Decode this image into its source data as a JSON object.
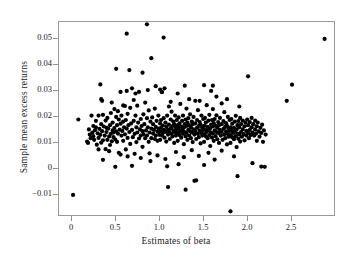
{
  "chart_data": {
    "type": "scatter",
    "title": "",
    "xlabel": "Estimates of beta",
    "ylabel": "Sample mean excess returns",
    "xlim": [
      -0.15,
      3.0
    ],
    "ylim": [
      -0.0185,
      0.0565
    ],
    "grid": false,
    "legend": null,
    "xticks": [
      0,
      0.5,
      1.0,
      1.5,
      2.0,
      2.5
    ],
    "xtick_labels": [
      "0",
      "0.5",
      "1.0",
      "1.5",
      "2.0",
      "2.5"
    ],
    "yticks": [
      0.05,
      0.04,
      0.03,
      0.02,
      0.01,
      0,
      -0.01
    ],
    "ytick_labels": [
      "0.05",
      "0.04",
      "0.03",
      "0.02",
      "0.01",
      "0",
      "−0.01"
    ],
    "marker": "filled-circle",
    "marker_color": "#000000",
    "marker_size_px": 2.1,
    "n_points": 402,
    "points": [
      [
        0.01,
        -0.01
      ],
      [
        0.07,
        0.019
      ],
      [
        0.17,
        0.0105
      ],
      [
        0.18,
        0.01
      ],
      [
        0.19,
        0.0152
      ],
      [
        0.2,
        0.0132
      ],
      [
        0.21,
        0.0118
      ],
      [
        0.22,
        0.0205
      ],
      [
        0.23,
        0.014
      ],
      [
        0.24,
        0.0126
      ],
      [
        0.25,
        0.0112
      ],
      [
        0.26,
        0.0149
      ],
      [
        0.27,
        0.016
      ],
      [
        0.28,
        0.0093
      ],
      [
        0.29,
        0.0137
      ],
      [
        0.3,
        0.0205
      ],
      [
        0.3,
        0.0119
      ],
      [
        0.31,
        0.0154
      ],
      [
        0.32,
        0.0325
      ],
      [
        0.32,
        0.0131
      ],
      [
        0.33,
        0.0268
      ],
      [
        0.33,
        0.0101
      ],
      [
        0.34,
        0.0262
      ],
      [
        0.34,
        0.0145
      ],
      [
        0.35,
        0.011
      ],
      [
        0.35,
        0.0035
      ],
      [
        0.36,
        0.0163
      ],
      [
        0.37,
        0.0128
      ],
      [
        0.38,
        0.0186
      ],
      [
        0.38,
        0.0076
      ],
      [
        0.39,
        0.0142
      ],
      [
        0.4,
        0.0196
      ],
      [
        0.4,
        0.0112
      ],
      [
        0.41,
        0.0155
      ],
      [
        0.42,
        0.0125
      ],
      [
        0.43,
        0.0168
      ],
      [
        0.43,
        0.0092
      ],
      [
        0.44,
        0.0215
      ],
      [
        0.44,
        0.0135
      ],
      [
        0.45,
        0.0106
      ],
      [
        0.46,
        0.0178
      ],
      [
        0.46,
        0.0148
      ],
      [
        0.47,
        0.0122
      ],
      [
        0.48,
        0.023
      ],
      [
        0.48,
        0.0157
      ],
      [
        0.49,
        0.0113
      ],
      [
        0.5,
        0.0385
      ],
      [
        0.5,
        0.02
      ],
      [
        0.5,
        0.0144
      ],
      [
        0.51,
        0.0168
      ],
      [
        0.51,
        0.0104
      ],
      [
        0.52,
        0.0222
      ],
      [
        0.52,
        0.0136
      ],
      [
        0.53,
        0.019
      ],
      [
        0.53,
        0.0062
      ],
      [
        0.54,
        0.0151
      ],
      [
        0.55,
        0.0296
      ],
      [
        0.55,
        0.0174
      ],
      [
        0.56,
        0.0128
      ],
      [
        0.56,
        0.0205
      ],
      [
        0.57,
        0.0146
      ],
      [
        0.58,
        0.0182
      ],
      [
        0.58,
        0.0108
      ],
      [
        0.59,
        0.016
      ],
      [
        0.6,
        0.0242
      ],
      [
        0.6,
        0.0133
      ],
      [
        0.61,
        0.0188
      ],
      [
        0.61,
        0.0075
      ],
      [
        0.62,
        0.052
      ],
      [
        0.62,
        0.0155
      ],
      [
        0.63,
        0.0212
      ],
      [
        0.63,
        0.0119
      ],
      [
        0.64,
        0.0168
      ],
      [
        0.65,
        0.038
      ],
      [
        0.65,
        0.0142
      ],
      [
        0.66,
        0.0235
      ],
      [
        0.66,
        0.0096
      ],
      [
        0.67,
        0.0175
      ],
      [
        0.68,
        0.031
      ],
      [
        0.68,
        0.015
      ],
      [
        0.69,
        0.0122
      ],
      [
        0.7,
        0.0265
      ],
      [
        0.7,
        0.0185
      ],
      [
        0.71,
        0.0135
      ],
      [
        0.71,
        0.0058
      ],
      [
        0.72,
        0.0205
      ],
      [
        0.73,
        0.016
      ],
      [
        0.73,
        0.0103
      ],
      [
        0.74,
        0.0243
      ],
      [
        0.74,
        0.014
      ],
      [
        0.75,
        0.0178
      ],
      [
        0.76,
        0.0117
      ],
      [
        0.76,
        0.0296
      ],
      [
        0.77,
        0.0152
      ],
      [
        0.78,
        0.0192
      ],
      [
        0.78,
        0.0128
      ],
      [
        0.79,
        0.0165
      ],
      [
        0.8,
        0.037
      ],
      [
        0.8,
        0.0145
      ],
      [
        0.8,
        0.0085
      ],
      [
        0.81,
        0.021
      ],
      [
        0.81,
        0.0133
      ],
      [
        0.82,
        0.0172
      ],
      [
        0.83,
        0.0118
      ],
      [
        0.83,
        0.0255
      ],
      [
        0.84,
        0.0148
      ],
      [
        0.85,
        0.0556
      ],
      [
        0.85,
        0.0195
      ],
      [
        0.85,
        0.0128
      ],
      [
        0.86,
        0.016
      ],
      [
        0.87,
        0.0225
      ],
      [
        0.87,
        0.0104
      ],
      [
        0.88,
        0.014
      ],
      [
        0.89,
        0.0182
      ],
      [
        0.89,
        0.003
      ],
      [
        0.9,
        0.0426
      ],
      [
        0.9,
        0.0155
      ],
      [
        0.9,
        0.0118
      ],
      [
        0.91,
        0.0198
      ],
      [
        0.92,
        0.0136
      ],
      [
        0.92,
        0.0172
      ],
      [
        0.93,
        0.015
      ],
      [
        0.94,
        0.0115
      ],
      [
        0.94,
        0.0232
      ],
      [
        0.95,
        0.0162
      ],
      [
        0.95,
        0.0128
      ],
      [
        0.96,
        0.0185
      ],
      [
        0.97,
        0.0143
      ],
      [
        0.97,
        0.0108
      ],
      [
        0.98,
        0.0205
      ],
      [
        0.98,
        0.0155
      ],
      [
        0.99,
        0.0131
      ],
      [
        1.0,
        0.0305
      ],
      [
        1.0,
        0.0175
      ],
      [
        1.0,
        0.0145
      ],
      [
        1.0,
        0.0112
      ],
      [
        1.01,
        0.0188
      ],
      [
        1.01,
        0.0158
      ],
      [
        1.02,
        0.0128
      ],
      [
        1.02,
        0.0296
      ],
      [
        1.03,
        0.0167
      ],
      [
        1.03,
        0.0138
      ],
      [
        1.04,
        0.0505
      ],
      [
        1.04,
        0.0195
      ],
      [
        1.04,
        0.015
      ],
      [
        1.05,
        0.012
      ],
      [
        1.05,
        0.031
      ],
      [
        1.06,
        0.0178
      ],
      [
        1.06,
        0.0142
      ],
      [
        1.07,
        0.0163
      ],
      [
        1.07,
        0.0105
      ],
      [
        1.08,
        0.0205
      ],
      [
        1.08,
        0.0152
      ],
      [
        1.09,
        0.0132
      ],
      [
        1.09,
        -0.007
      ],
      [
        1.1,
        0.024
      ],
      [
        1.1,
        0.017
      ],
      [
        1.1,
        0.0144
      ],
      [
        1.11,
        0.0115
      ],
      [
        1.12,
        0.019
      ],
      [
        1.12,
        0.0156
      ],
      [
        1.13,
        0.0135
      ],
      [
        1.13,
        0.022
      ],
      [
        1.14,
        0.0165
      ],
      [
        1.14,
        0.0125
      ],
      [
        1.15,
        0.0182
      ],
      [
        1.15,
        0.0148
      ],
      [
        1.16,
        0.0172
      ],
      [
        1.16,
        0.01
      ],
      [
        1.17,
        0.0205
      ],
      [
        1.17,
        0.014
      ],
      [
        1.18,
        0.016
      ],
      [
        1.18,
        0.0128
      ],
      [
        1.19,
        0.0188
      ],
      [
        1.19,
        0.0152
      ],
      [
        1.2,
        0.029
      ],
      [
        1.2,
        0.0168
      ],
      [
        1.2,
        0.0138
      ],
      [
        1.2,
        0.0108
      ],
      [
        1.21,
        0.0198
      ],
      [
        1.21,
        0.0155
      ],
      [
        1.22,
        0.013
      ],
      [
        1.22,
        0.0175
      ],
      [
        1.23,
        0.0145
      ],
      [
        1.23,
        0.025
      ],
      [
        1.24,
        0.0163
      ],
      [
        1.24,
        0.012
      ],
      [
        1.25,
        0.0185
      ],
      [
        1.25,
        0.015
      ],
      [
        1.26,
        0.0135
      ],
      [
        1.26,
        0.0205
      ],
      [
        1.27,
        0.0158
      ],
      [
        1.27,
        0.0095
      ],
      [
        1.28,
        0.032
      ],
      [
        1.28,
        0.0172
      ],
      [
        1.28,
        0.0142
      ],
      [
        1.29,
        0.019
      ],
      [
        1.29,
        0.0125
      ],
      [
        1.29,
        -0.008
      ],
      [
        1.3,
        0.0232
      ],
      [
        1.3,
        0.0165
      ],
      [
        1.3,
        0.0138
      ],
      [
        1.31,
        0.0178
      ],
      [
        1.31,
        0.0112
      ],
      [
        1.32,
        0.0195
      ],
      [
        1.32,
        0.015
      ],
      [
        1.33,
        0.0128
      ],
      [
        1.33,
        0.0168
      ],
      [
        1.34,
        0.0145
      ],
      [
        1.34,
        0.021
      ],
      [
        1.35,
        0.016
      ],
      [
        1.35,
        0.0118
      ],
      [
        1.36,
        0.0182
      ],
      [
        1.36,
        0.014
      ],
      [
        1.37,
        0.0172
      ],
      [
        1.37,
        0.0103
      ],
      [
        1.38,
        0.02
      ],
      [
        1.38,
        0.0152
      ],
      [
        1.39,
        0.0132
      ],
      [
        1.39,
        -0.0046
      ],
      [
        1.4,
        0.0262
      ],
      [
        1.4,
        0.0175
      ],
      [
        1.4,
        0.0145
      ],
      [
        1.41,
        0.0115
      ],
      [
        1.41,
        -0.0044
      ],
      [
        1.42,
        0.0188
      ],
      [
        1.42,
        0.0158
      ],
      [
        1.43,
        0.0135
      ],
      [
        1.43,
        0.0226
      ],
      [
        1.44,
        0.0165
      ],
      [
        1.44,
        0.0122
      ],
      [
        1.45,
        0.018
      ],
      [
        1.45,
        0.0148
      ],
      [
        1.46,
        0.017
      ],
      [
        1.46,
        0.0098
      ],
      [
        1.47,
        0.0205
      ],
      [
        1.47,
        0.0138
      ],
      [
        1.48,
        0.016
      ],
      [
        1.48,
        0.0128
      ],
      [
        1.49,
        0.0192
      ],
      [
        1.49,
        0.015
      ],
      [
        1.5,
        0.0322
      ],
      [
        1.5,
        0.0166
      ],
      [
        1.5,
        0.0134
      ],
      [
        1.5,
        0.0104
      ],
      [
        1.51,
        0.0196
      ],
      [
        1.51,
        0.0152
      ],
      [
        1.52,
        0.0126
      ],
      [
        1.52,
        0.0178
      ],
      [
        1.53,
        0.0142
      ],
      [
        1.53,
        0.0245
      ],
      [
        1.54,
        0.0162
      ],
      [
        1.54,
        0.0118
      ],
      [
        1.55,
        0.0186
      ],
      [
        1.55,
        0.0148
      ],
      [
        1.56,
        0.013
      ],
      [
        1.56,
        0.0208
      ],
      [
        1.57,
        0.0156
      ],
      [
        1.57,
        0.0088
      ],
      [
        1.58,
        0.03
      ],
      [
        1.58,
        0.017
      ],
      [
        1.58,
        0.014
      ],
      [
        1.59,
        0.0188
      ],
      [
        1.59,
        0.012
      ],
      [
        1.6,
        0.032
      ],
      [
        1.6,
        0.023
      ],
      [
        1.6,
        0.0164
      ],
      [
        1.6,
        0.0136
      ],
      [
        1.61,
        0.0176
      ],
      [
        1.61,
        0.0108
      ],
      [
        1.62,
        0.0192
      ],
      [
        1.62,
        0.0148
      ],
      [
        1.63,
        0.0126
      ],
      [
        1.63,
        0.0166
      ],
      [
        1.64,
        0.0142
      ],
      [
        1.64,
        0.0206
      ],
      [
        1.65,
        0.0158
      ],
      [
        1.65,
        0.0114
      ],
      [
        1.66,
        0.018
      ],
      [
        1.66,
        0.0138
      ],
      [
        1.67,
        0.0168
      ],
      [
        1.67,
        0.01
      ],
      [
        1.68,
        0.0196
      ],
      [
        1.68,
        0.015
      ],
      [
        1.69,
        0.0128
      ],
      [
        1.7,
        0.0252
      ],
      [
        1.7,
        0.0172
      ],
      [
        1.7,
        0.0142
      ],
      [
        1.71,
        0.0112
      ],
      [
        1.72,
        0.0184
      ],
      [
        1.72,
        0.0154
      ],
      [
        1.73,
        0.0132
      ],
      [
        1.73,
        0.0218
      ],
      [
        1.74,
        0.0162
      ],
      [
        1.74,
        0.0118
      ],
      [
        1.75,
        0.0176
      ],
      [
        1.75,
        0.0144
      ],
      [
        1.76,
        0.0166
      ],
      [
        1.76,
        0.0094
      ],
      [
        1.77,
        0.02
      ],
      [
        1.77,
        0.0134
      ],
      [
        1.78,
        0.0156
      ],
      [
        1.78,
        0.0124
      ],
      [
        1.79,
        0.0188
      ],
      [
        1.79,
        0.0146
      ],
      [
        1.8,
        0.016
      ],
      [
        1.8,
        0.013
      ],
      [
        1.8,
        0.01
      ],
      [
        1.8,
        -0.0163
      ],
      [
        1.81,
        0.0192
      ],
      [
        1.81,
        0.0148
      ],
      [
        1.82,
        0.0122
      ],
      [
        1.82,
        0.0174
      ],
      [
        1.83,
        0.0138
      ],
      [
        1.84,
        0.0158
      ],
      [
        1.84,
        0.0114
      ],
      [
        1.85,
        0.0182
      ],
      [
        1.85,
        0.0144
      ],
      [
        1.86,
        0.0126
      ],
      [
        1.86,
        0.0204
      ],
      [
        1.87,
        0.0152
      ],
      [
        1.87,
        0.0084
      ],
      [
        1.88,
        0.0168
      ],
      [
        1.88,
        0.0136
      ],
      [
        1.88,
        -0.0028
      ],
      [
        1.89,
        0.0184
      ],
      [
        1.89,
        0.0116
      ],
      [
        1.9,
        0.024
      ],
      [
        1.9,
        0.016
      ],
      [
        1.9,
        0.0132
      ],
      [
        1.91,
        0.0196
      ],
      [
        1.91,
        0.0105
      ],
      [
        1.92,
        0.0172
      ],
      [
        1.92,
        0.0142
      ],
      [
        1.93,
        0.0124
      ],
      [
        1.94,
        0.0186
      ],
      [
        1.94,
        0.0152
      ],
      [
        1.95,
        0.0134
      ],
      [
        1.96,
        0.0164
      ],
      [
        1.96,
        0.011
      ],
      [
        1.97,
        0.0178
      ],
      [
        1.98,
        0.0146
      ],
      [
        1.98,
        0.0128
      ],
      [
        1.99,
        0.019
      ],
      [
        2.0,
        0.0356
      ],
      [
        2.0,
        0.0168
      ],
      [
        2.0,
        0.0138
      ],
      [
        2.01,
        0.0118
      ],
      [
        2.02,
        0.018
      ],
      [
        2.02,
        0.015
      ],
      [
        2.03,
        0.013
      ],
      [
        2.04,
        0.0196
      ],
      [
        2.04,
        0.016
      ],
      [
        2.05,
        0.014
      ],
      [
        2.05,
        0.0022
      ],
      [
        2.06,
        0.0172
      ],
      [
        2.07,
        0.0128
      ],
      [
        2.08,
        0.0186
      ],
      [
        2.08,
        0.0152
      ],
      [
        2.09,
        0.0136
      ],
      [
        2.1,
        0.0164
      ],
      [
        2.1,
        0.0108
      ],
      [
        2.11,
        0.0178
      ],
      [
        2.12,
        0.0144
      ],
      [
        2.13,
        0.0124
      ],
      [
        2.14,
        0.0158
      ],
      [
        2.15,
        0.0138
      ],
      [
        2.15,
        0.0009
      ],
      [
        2.16,
        0.017
      ],
      [
        2.17,
        0.0104
      ],
      [
        2.18,
        0.0148
      ],
      [
        2.19,
        0.0008
      ],
      [
        2.2,
        0.0132
      ],
      [
        2.44,
        0.0262
      ],
      [
        2.5,
        0.0324
      ],
      [
        2.87,
        0.05
      ],
      [
        0.49,
        0.0008
      ],
      [
        0.62,
        0.03
      ],
      [
        0.86,
        0.0303
      ],
      [
        0.95,
        0.0318
      ],
      [
        1.02,
        0.0295
      ],
      [
        0.72,
        0.029
      ],
      [
        0.45,
        0.0255
      ],
      [
        0.58,
        0.0244
      ],
      [
        1.12,
        0.0258
      ],
      [
        1.33,
        0.0268
      ],
      [
        1.45,
        0.0262
      ],
      [
        1.64,
        0.0278
      ],
      [
        1.76,
        0.0268
      ],
      [
        0.35,
        0.0208
      ],
      [
        0.42,
        0.0068
      ],
      [
        0.55,
        0.0055
      ],
      [
        0.63,
        0.0048
      ],
      [
        0.78,
        0.0042
      ],
      [
        0.88,
        0.006
      ],
      [
        0.97,
        0.0052
      ],
      [
        1.06,
        0.0038
      ],
      [
        1.18,
        0.0065
      ],
      [
        1.27,
        0.0045
      ],
      [
        1.36,
        0.0072
      ],
      [
        1.44,
        0.005
      ],
      [
        1.55,
        0.0062
      ],
      [
        1.62,
        0.0036
      ],
      [
        1.7,
        0.007
      ],
      [
        1.84,
        0.0048
      ],
      [
        0.3,
        0.0075
      ],
      [
        0.68,
        0.0012
      ],
      [
        1.08,
        0.001
      ],
      [
        1.21,
        0.0018
      ],
      [
        1.5,
        0.0015
      ],
      [
        0.24,
        0.0165
      ],
      [
        0.27,
        0.0185
      ],
      [
        0.33,
        0.0172
      ],
      [
        0.39,
        0.0158
      ],
      [
        0.47,
        0.014
      ]
    ]
  },
  "axes": {
    "x_title": "Estimates of beta",
    "y_title": "Sample mean excess returns"
  },
  "style": {
    "frame_color": "#9a9a9a",
    "background": "#ffffff",
    "point_color": "#000000"
  }
}
